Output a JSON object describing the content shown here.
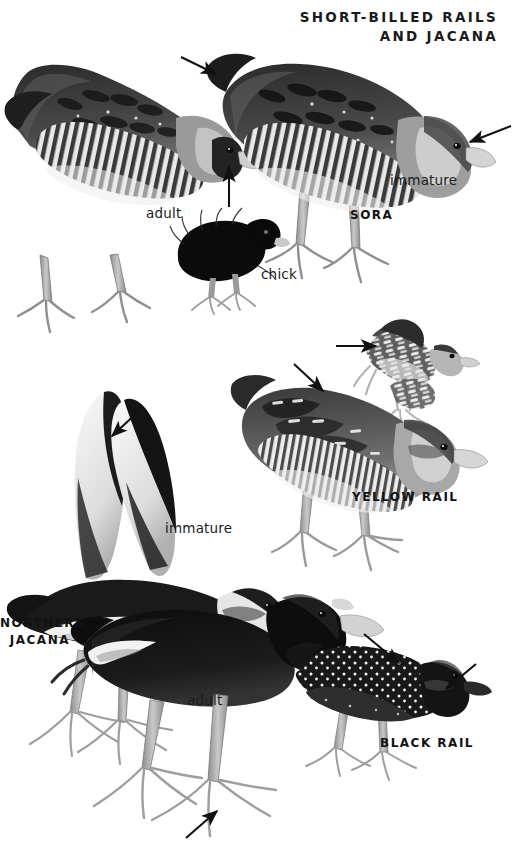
{
  "plate": {
    "title_line1": "SHORT-BILLED RAILS",
    "title_line2": "AND JACANA",
    "background": "#ffffff",
    "ink": "#1a1a1a",
    "width": 514,
    "height": 863
  },
  "labels": {
    "sora_adult": "adult",
    "sora_chick": "chick",
    "sora_immature": "immature",
    "sora_species": "SORA",
    "yellow_rail_species": "YELLOW RAIL",
    "jacana_immature": "immature",
    "jacana_species_line1": "NORTHERN",
    "jacana_species_line2": "JACANA",
    "jacana_adult": "adult",
    "black_rail_species": "BLACK RAIL"
  },
  "figures": [
    {
      "name": "sora-adult",
      "species": "SORA",
      "age": "adult",
      "pose": "standing, head lowered, left-facing"
    },
    {
      "name": "sora-immature",
      "species": "SORA",
      "age": "immature",
      "pose": "standing, head lowered, right-facing"
    },
    {
      "name": "sora-chick",
      "species": "SORA",
      "age": "chick",
      "pose": "downy black chick, standing"
    },
    {
      "name": "yellow-rail-standing",
      "species": "YELLOW RAIL",
      "age": "adult",
      "pose": "standing, right-facing"
    },
    {
      "name": "yellow-rail-flying",
      "species": "YELLOW RAIL",
      "age": "adult",
      "pose": "in flight, right-facing"
    },
    {
      "name": "northern-jacana-immature",
      "species": "NORTHERN JACANA",
      "age": "immature",
      "pose": "wings raised, right-facing"
    },
    {
      "name": "northern-jacana-adult",
      "species": "NORTHERN JACANA",
      "age": "adult",
      "pose": "walking, right-facing"
    },
    {
      "name": "black-rail",
      "species": "BLACK RAIL",
      "age": "adult",
      "pose": "standing, right-facing"
    }
  ],
  "annotations": [
    {
      "name": "arrow-sora-immature-wing",
      "points_to": "wing coverts of immature Sora"
    },
    {
      "name": "arrow-sora-immature-bill",
      "points_to": "bill of immature Sora"
    },
    {
      "name": "arrow-sora-adult-face",
      "points_to": "black face and bill of adult Sora"
    },
    {
      "name": "arrow-yellow-rail-flight-wing",
      "points_to": "white secondaries in flight"
    },
    {
      "name": "arrow-yellow-rail-back",
      "points_to": "back pattern of standing Yellow Rail"
    },
    {
      "name": "arrow-jacana-wing",
      "points_to": "yellow flight feathers of immature Jacana"
    },
    {
      "name": "arrow-jacana-toes",
      "points_to": "long toes of adult Jacana"
    },
    {
      "name": "arrow-black-rail-back",
      "points_to": "white spotting on back"
    },
    {
      "name": "arrow-black-rail-bill",
      "points_to": "bill of Black Rail"
    }
  ]
}
